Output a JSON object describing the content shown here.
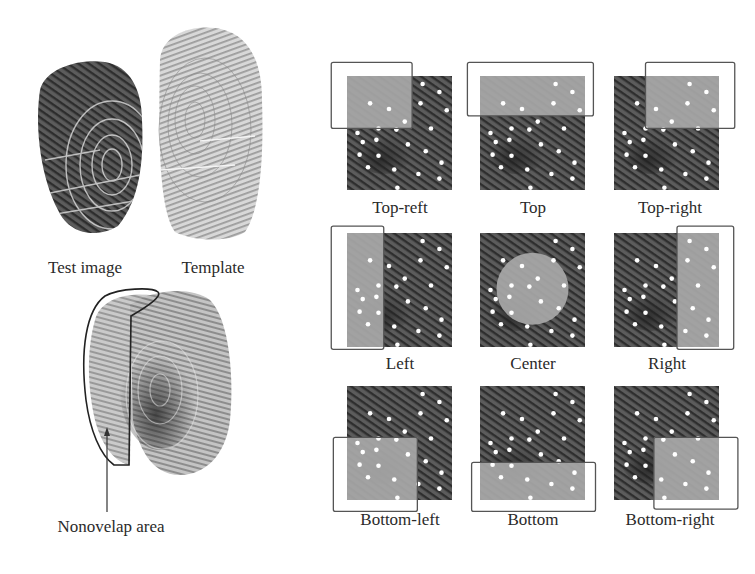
{
  "left_panel": {
    "top_labels": {
      "test_image": "Test image",
      "template": "Template"
    },
    "overlap_label": "Nonovelap area"
  },
  "grid": {
    "cells": [
      {
        "id": "top-left",
        "label": "Top-reft"
      },
      {
        "id": "top",
        "label": "Top"
      },
      {
        "id": "top-right",
        "label": "Top-right"
      },
      {
        "id": "left",
        "label": "Left"
      },
      {
        "id": "center",
        "label": "Center"
      },
      {
        "id": "right",
        "label": "Right"
      },
      {
        "id": "bottom-left",
        "label": "Bottom-left"
      },
      {
        "id": "bottom",
        "label": "Bottom"
      },
      {
        "id": "bottom-right",
        "label": "Bottom-right"
      }
    ]
  },
  "colors": {
    "dark_print": "#4a4a4a",
    "light_region": "#9a9a9a",
    "minutiae_dot": "#ffffff",
    "frame_line": "#555555"
  }
}
